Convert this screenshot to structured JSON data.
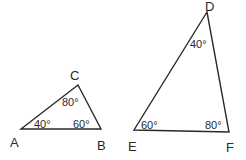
{
  "diagram": {
    "triangles": [
      {
        "name": "ABC",
        "vertices": [
          {
            "label": "A",
            "x": 21,
            "y": 129
          },
          {
            "label": "B",
            "x": 101,
            "y": 129
          },
          {
            "label": "C",
            "x": 78,
            "y": 85
          }
        ],
        "angles": {
          "A": "40°",
          "B": "60°",
          "C": "80°"
        }
      },
      {
        "name": "DEF",
        "vertices": [
          {
            "label": "D",
            "x": 207,
            "y": 12
          },
          {
            "label": "E",
            "x": 134,
            "y": 130
          },
          {
            "label": "F",
            "x": 229,
            "y": 132
          }
        ],
        "angles": {
          "D": "40°",
          "E": "60°",
          "F": "80°"
        }
      }
    ],
    "line_color": "#2a2a2a"
  }
}
